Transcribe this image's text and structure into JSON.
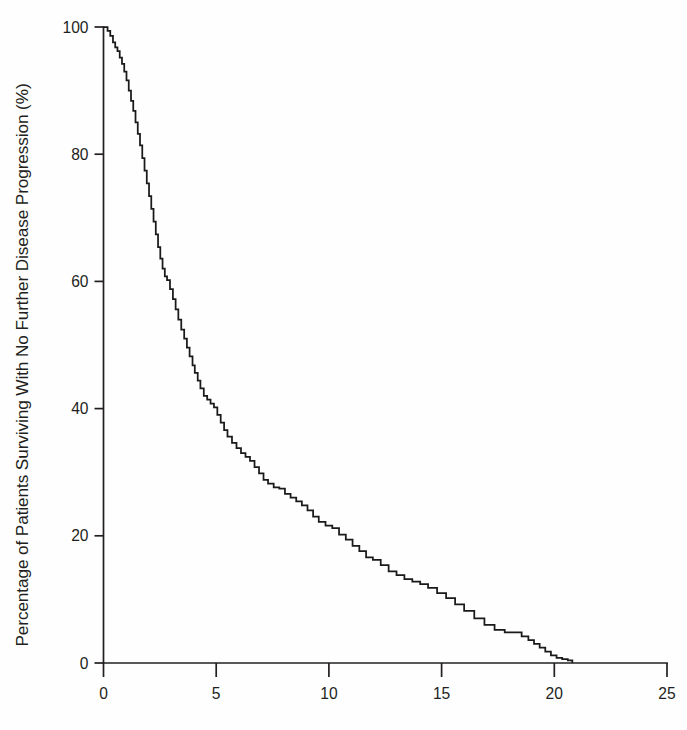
{
  "figure": {
    "background_color": "#ffffff",
    "line_color": "#1a1a1a",
    "axis_color": "#231f20",
    "width": 687,
    "height": 730
  },
  "chart_data": {
    "type": "line",
    "title": "",
    "subtitle": "",
    "xlabel": "",
    "ylabel": "Percentage of Patients Surviving With No Further Disease Progression (%)",
    "xlim": [
      0,
      25
    ],
    "ylim": [
      0,
      100
    ],
    "xticks": [
      0,
      5,
      10,
      15,
      20,
      25
    ],
    "xticklabels": [
      "0",
      "5",
      "10",
      "15",
      "20",
      "25"
    ],
    "yticks": [
      0,
      20,
      40,
      60,
      80,
      100
    ],
    "yticklabels": [
      "0",
      "20",
      "40",
      "60",
      "80",
      "100"
    ],
    "grid": false,
    "legend": null,
    "legend_position": "none",
    "annotations": [],
    "series": [
      {
        "name": "Progression-free survival",
        "step": "post",
        "x": [
          0.0,
          0.18,
          0.3,
          0.42,
          0.52,
          0.62,
          0.72,
          0.82,
          0.92,
          1.02,
          1.12,
          1.22,
          1.32,
          1.42,
          1.52,
          1.62,
          1.72,
          1.82,
          1.92,
          2.02,
          2.12,
          2.22,
          2.32,
          2.42,
          2.52,
          2.62,
          2.72,
          2.82,
          2.95,
          3.08,
          3.2,
          3.32,
          3.45,
          3.58,
          3.7,
          3.82,
          3.95,
          4.05,
          4.18,
          4.3,
          4.45,
          4.6,
          4.75,
          4.9,
          5.05,
          5.2,
          5.35,
          5.5,
          5.7,
          5.9,
          6.1,
          6.3,
          6.5,
          6.7,
          6.9,
          7.1,
          7.3,
          7.55,
          7.8,
          8.05,
          8.3,
          8.55,
          8.8,
          9.05,
          9.3,
          9.55,
          9.85,
          10.15,
          10.45,
          10.75,
          11.05,
          11.35,
          11.65,
          11.95,
          12.3,
          12.65,
          13.0,
          13.35,
          13.7,
          14.05,
          14.4,
          14.8,
          15.2,
          15.6,
          16.0,
          16.45,
          16.9,
          17.35,
          17.8,
          18.2,
          18.55,
          18.85,
          19.1,
          19.35,
          19.6,
          19.85,
          20.1,
          20.35,
          20.6,
          20.8
        ],
        "y": [
          100.0,
          99.4,
          98.6,
          97.6,
          96.8,
          96.2,
          95.2,
          94.2,
          93.0,
          91.6,
          90.0,
          88.4,
          86.8,
          85.0,
          83.2,
          81.4,
          79.4,
          77.4,
          75.4,
          73.4,
          71.4,
          69.4,
          67.4,
          65.4,
          63.6,
          62.0,
          60.8,
          60.2,
          58.8,
          57.2,
          55.6,
          54.0,
          52.4,
          51.0,
          49.6,
          48.2,
          46.8,
          45.6,
          44.4,
          43.2,
          42.0,
          41.4,
          40.8,
          40.2,
          39.0,
          37.8,
          36.6,
          35.6,
          34.6,
          33.8,
          33.0,
          32.4,
          31.8,
          30.8,
          29.8,
          28.8,
          28.2,
          27.6,
          27.4,
          26.6,
          26.0,
          25.4,
          24.8,
          24.0,
          23.0,
          22.2,
          21.6,
          21.2,
          20.2,
          19.4,
          18.4,
          17.6,
          16.6,
          16.2,
          15.4,
          14.4,
          13.8,
          13.2,
          12.8,
          12.4,
          11.8,
          11.0,
          10.2,
          9.2,
          8.2,
          7.0,
          6.0,
          5.2,
          4.8,
          4.8,
          4.2,
          3.6,
          3.0,
          2.4,
          1.8,
          1.2,
          0.8,
          0.6,
          0.4,
          0.0
        ]
      }
    ]
  }
}
